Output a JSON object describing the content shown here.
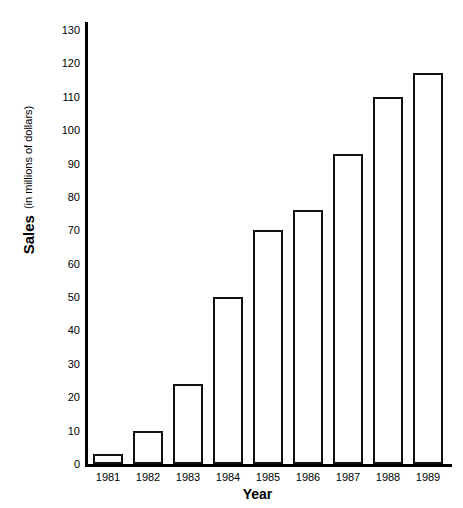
{
  "chart_data": {
    "type": "bar",
    "title": "",
    "xlabel": "Year",
    "ylabel": "Sales",
    "ylabel_sub": "(in millions of dollars)",
    "categories": [
      "1981",
      "1982",
      "1983",
      "1984",
      "1985",
      "1986",
      "1987",
      "1988",
      "1989"
    ],
    "values": [
      3,
      10,
      24,
      50,
      70,
      76,
      93,
      110,
      117
    ],
    "ylim": [
      0,
      130
    ],
    "ytick_step": 10,
    "yticks": [
      0,
      10,
      20,
      30,
      40,
      50,
      60,
      70,
      80,
      90,
      100,
      110,
      120,
      130
    ],
    "ytick_labels": [
      "0",
      "10",
      "20",
      "30",
      "40",
      "50",
      "60",
      "70",
      "80",
      "90",
      "100",
      "110",
      "120",
      "130"
    ],
    "grid": false,
    "legend": false,
    "bar_fill_color": "#ffffff",
    "bar_edge_color": "#111111",
    "axis_color": "#000000",
    "background_color": "#ffffff"
  }
}
